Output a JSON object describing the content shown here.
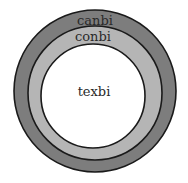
{
  "diagram": {
    "type": "concentric-circles",
    "rings": [
      {
        "label": "canbi",
        "color": "#7d7d7d",
        "role": "outer"
      },
      {
        "label": "conbi",
        "color": "#b5b5b5",
        "role": "middle"
      },
      {
        "label": "texbi",
        "color": "#ffffff",
        "role": "inner"
      }
    ],
    "stroke_color": "#1a1a1a"
  }
}
